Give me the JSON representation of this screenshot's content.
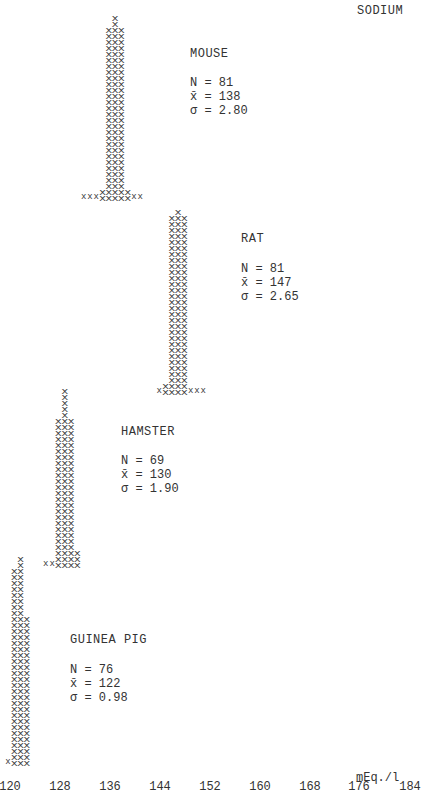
{
  "chart_data": {
    "type": "histogram",
    "title": "SODIUM",
    "xlabel": "mEq./l",
    "ylabel": "",
    "x_ticks": [
      120,
      128,
      136,
      144,
      152,
      160,
      168,
      176,
      184
    ],
    "xlim": [
      120,
      184
    ],
    "grid": false,
    "legend": "none; each panel labeled inline",
    "series": [
      {
        "name": "MOUSE",
        "N": 81,
        "mean": 138,
        "sd": 2.8,
        "stats_text": [
          "N = 81",
          "x̄ = 138",
          "σ = 2.80"
        ],
        "baseline_y": 203,
        "bins": [
          {
            "x": 132,
            "count": 1
          },
          {
            "x": 133,
            "count": 1
          },
          {
            "x": 134,
            "count": 1
          },
          {
            "x": 135,
            "count": 2
          },
          {
            "x": 136,
            "count": 29
          },
          {
            "x": 137,
            "count": 31
          },
          {
            "x": 138,
            "count": 29
          },
          {
            "x": 139,
            "count": 2
          },
          {
            "x": 140,
            "count": 1
          },
          {
            "x": 141,
            "count": 1
          }
        ]
      },
      {
        "name": "RAT",
        "N": 81,
        "mean": 147,
        "sd": 2.65,
        "stats_text": [
          "N = 81",
          "x̄ = 147",
          "σ = 2.65"
        ],
        "baseline_y": 397,
        "bins": [
          {
            "x": 144,
            "count": 1
          },
          {
            "x": 145,
            "count": 2
          },
          {
            "x": 146,
            "count": 30
          },
          {
            "x": 147,
            "count": 31
          },
          {
            "x": 148,
            "count": 30
          },
          {
            "x": 149,
            "count": 1
          },
          {
            "x": 150,
            "count": 1
          },
          {
            "x": 151,
            "count": 1
          }
        ]
      },
      {
        "name": "HAMSTER",
        "N": 69,
        "mean": 130,
        "sd": 1.9,
        "stats_text": [
          "N = 69",
          "x̄ = 130",
          "σ = 1.90"
        ],
        "baseline_y": 570,
        "bins": [
          {
            "x": 126,
            "count": 1
          },
          {
            "x": 127,
            "count": 1
          },
          {
            "x": 128,
            "count": 25
          },
          {
            "x": 129,
            "count": 30
          },
          {
            "x": 130,
            "count": 25
          },
          {
            "x": 131,
            "count": 3
          }
        ]
      },
      {
        "name": "GUINEA PIG",
        "N": 76,
        "mean": 122,
        "sd": 0.98,
        "stats_text": [
          "N = 76",
          "x̄ = 122",
          "σ = 0.98"
        ],
        "baseline_y": 768,
        "bins": [
          {
            "x": 120,
            "count": 1
          },
          {
            "x": 121,
            "count": 33
          },
          {
            "x": 122,
            "count": 35
          },
          {
            "x": 123,
            "count": 25
          }
        ]
      }
    ]
  },
  "labels": {
    "title": "SODIUM",
    "unit": "mEq./l",
    "ticks": [
      "120",
      "128",
      "136",
      "144",
      "152",
      "160",
      "168",
      "176",
      "184"
    ],
    "mouse": {
      "name": "MOUSE",
      "n": "N = 81",
      "mean": "x̄ = 138",
      "sd": "σ = 2.80"
    },
    "rat": {
      "name": "RAT",
      "n": "N = 81",
      "mean": "x̄ = 147",
      "sd": "σ = 2.65"
    },
    "hamster": {
      "name": "HAMSTER",
      "n": "N = 69",
      "mean": "x̄ = 130",
      "sd": "σ = 1.90"
    },
    "guinea_pig": {
      "name": "GUINEA PIG",
      "n": "N = 76",
      "mean": "x̄ = 122",
      "sd": "σ = 0.98"
    }
  }
}
